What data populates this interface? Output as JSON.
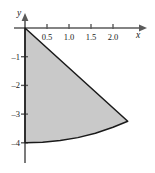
{
  "figure": {
    "kind": "cartesian-plot",
    "background_color": "#ffffff",
    "axis_color": "#4a4a4a",
    "curve_color": "#1a1a1a",
    "fill_color": "#c9c9c9"
  },
  "axes": {
    "x_label": "x",
    "y_label": "y",
    "x_ticks": [
      {
        "value": 0.5,
        "label": "0.5"
      },
      {
        "value": 1.0,
        "label": "1.0"
      },
      {
        "value": 1.5,
        "label": "1.5"
      },
      {
        "value": 2.0,
        "label": "2.0"
      }
    ],
    "y_ticks": [
      {
        "value": -1,
        "label": "–1"
      },
      {
        "value": -2,
        "label": "–2"
      },
      {
        "value": -3,
        "label": "–3"
      },
      {
        "value": -4,
        "label": "–4"
      }
    ]
  },
  "chart_data": {
    "type": "area",
    "title": "",
    "xlabel": "x",
    "ylabel": "y",
    "xlim": [
      -0.15,
      2.8
    ],
    "ylim": [
      -4.6,
      0.4
    ],
    "grid": false,
    "legend": null,
    "shaded_region": {
      "description": "circular sector of radius 4 centered at the origin, bounded left by the negative y-axis, right by a straight radius, and below by a circular arc",
      "fill": "#c9c9c9",
      "radius": 4,
      "center": [
        0,
        0
      ],
      "start_angle_deg": -90,
      "end_angle_deg": -54.3,
      "vertices": [
        {
          "x": 0,
          "y": 0
        },
        {
          "x": 2.335,
          "y": -3.25
        },
        {
          "x": 0,
          "y": -4
        }
      ],
      "arc_points": [
        {
          "x": 0.0,
          "y": -4.0
        },
        {
          "x": 0.4,
          "y": -3.98
        },
        {
          "x": 0.8,
          "y": -3.92
        },
        {
          "x": 1.2,
          "y": -3.82
        },
        {
          "x": 1.6,
          "y": -3.67
        },
        {
          "x": 2.0,
          "y": -3.46
        },
        {
          "x": 2.335,
          "y": -3.25
        }
      ]
    }
  }
}
